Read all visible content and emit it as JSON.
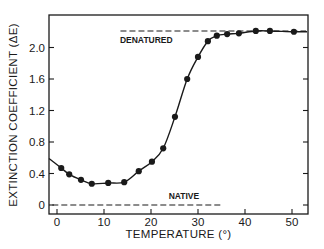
{
  "chart_data": {
    "type": "line",
    "title": "",
    "xlabel": "TEMPERATURE (°)",
    "ylabel": "EXTINCTION COEFFICIENT (ΔE)",
    "xlim": [
      -1.7,
      53.5
    ],
    "ylim": [
      -0.11,
      2.41
    ],
    "xticks": [
      0,
      10,
      20,
      30,
      40,
      50
    ],
    "xtick_labels": [
      "0",
      "10",
      "20",
      "30",
      "40",
      "50"
    ],
    "yticks": [
      0,
      0.4,
      0.8,
      1.2,
      1.6,
      2.0
    ],
    "ytick_labels": [
      "0",
      "0.4",
      "0.8",
      "1.2",
      "1.6",
      "2.0"
    ],
    "grid": false,
    "legend": null,
    "series": [
      {
        "name": "measured",
        "style": "markers-with-smooth-curve",
        "x": [
          0.9,
          2.6,
          5.1,
          7.4,
          10.9,
          14.3,
          17.4,
          20.2,
          22.6,
          25.1,
          27.7,
          30.0,
          32.1,
          34.0,
          36.2,
          38.7,
          42.3,
          45.3,
          50.4
        ],
        "y": [
          0.47,
          0.39,
          0.32,
          0.27,
          0.28,
          0.29,
          0.43,
          0.55,
          0.72,
          1.12,
          1.6,
          1.88,
          2.08,
          2.15,
          2.17,
          2.18,
          2.21,
          2.21,
          2.2
        ]
      }
    ],
    "curve_start": {
      "x": -1.7,
      "y": 0.59
    },
    "reference_lines": [
      {
        "label": "DENATURED",
        "y": 2.21,
        "x_from": 13.5,
        "x_to": 53,
        "style": "dashed"
      },
      {
        "label": "NATIVE",
        "y": 0.0,
        "x_from": -1.0,
        "x_to": 35,
        "style": "dashed"
      }
    ],
    "annotations": [
      {
        "text": "DENATURED",
        "x": 19,
        "y": 2.06
      },
      {
        "text": "NATIVE",
        "x": 27,
        "y": 0.07
      }
    ]
  },
  "colors": {
    "ink": "#1a1a1a",
    "background": "#ffffff"
  }
}
